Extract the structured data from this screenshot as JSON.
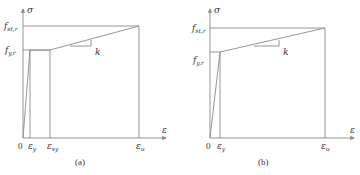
{
  "figure": {
    "panels": [
      {
        "id": "a",
        "caption": "(a)",
        "y_axis_label": "σ",
        "x_axis_label": "ε",
        "origin_label": "0",
        "y_ticks": [
          {
            "base": "f",
            "sub": "st,r"
          },
          {
            "base": "f",
            "sub": "y,r"
          }
        ],
        "x_ticks": [
          {
            "base": "ε",
            "sub": "y"
          },
          {
            "base": "ε",
            "sub": "sy"
          },
          {
            "base": "ε",
            "sub": "u"
          }
        ],
        "slope_label": "k",
        "description": "Elastic rise to f_y,r at ε_y, yield plateau to ε_sy, linear hardening with slope k to f_st,r at ε_u"
      },
      {
        "id": "b",
        "caption": "(b)",
        "y_axis_label": "σ",
        "x_axis_label": "ε",
        "origin_label": "0",
        "y_ticks": [
          {
            "base": "f",
            "sub": "st,r"
          },
          {
            "base": "f",
            "sub": "y,r"
          }
        ],
        "x_ticks": [
          {
            "base": "ε",
            "sub": "y"
          },
          {
            "base": "ε",
            "sub": "u"
          }
        ],
        "slope_label": "k",
        "description": "Elastic rise to f_y,r at ε_y, then linear hardening with slope k to f_st,r at ε_u (no plateau)"
      }
    ],
    "line_color": "#8a8a8a",
    "text_color": "#333333"
  }
}
